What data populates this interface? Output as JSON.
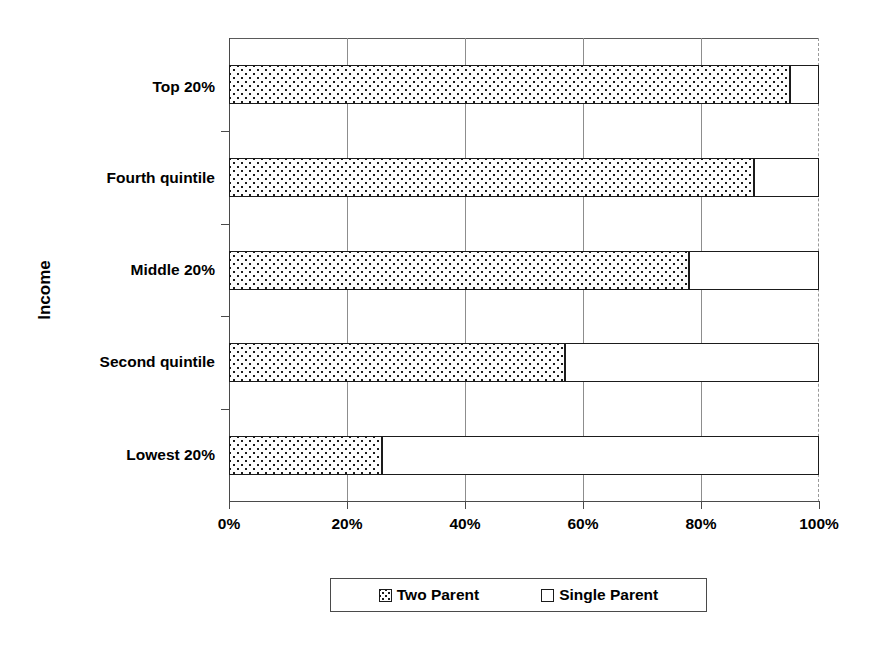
{
  "chart_data": {
    "type": "bar",
    "orientation": "horizontal",
    "stacked": true,
    "stack_mode": "percent",
    "title": "",
    "subtitle": "",
    "xlabel": "",
    "ylabel": "Income",
    "categories": [
      "Lowest 20%",
      "Second quintile",
      "Middle 20%",
      "Fourth quintile",
      "Top 20%"
    ],
    "series": [
      {
        "name": "Two Parent",
        "values": [
          26,
          57,
          78,
          89,
          95
        ]
      },
      {
        "name": "Single Parent",
        "values": [
          74,
          43,
          22,
          11,
          5
        ]
      }
    ],
    "xlim": [
      0,
      100
    ],
    "xticks": [
      0,
      20,
      40,
      60,
      80,
      100
    ],
    "xtick_labels": [
      "0%",
      "20%",
      "40%",
      "60%",
      "80%",
      "100%"
    ],
    "grid": "vertical",
    "legend_position": "bottom",
    "legend_entries": [
      {
        "label": "Two Parent",
        "swatch": "dotted-pattern-swatch"
      },
      {
        "label": "Single Parent",
        "swatch": "white-swatch"
      }
    ],
    "colors": {
      "two_parent_fill": "#fdfdfd",
      "two_parent_pattern": "#1b1b1b",
      "single_parent_fill": "#ffffff",
      "bar_outline": "#1b1b1b",
      "axis": "#4a4a4a",
      "gridline": "#8d8d8d",
      "background": "#ffffff",
      "text": "#000000"
    }
  }
}
